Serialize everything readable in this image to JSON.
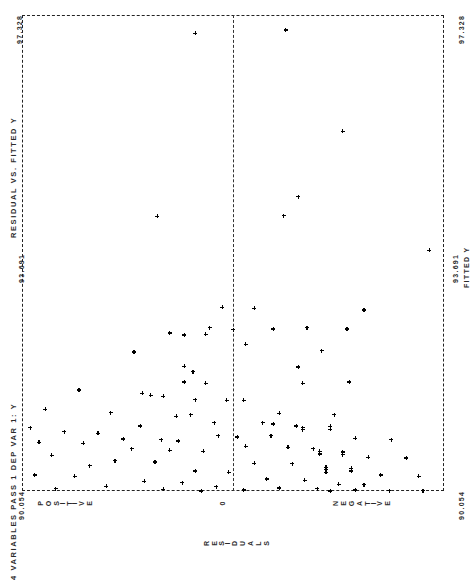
{
  "report": {
    "header_left": "4 VARIABLES  PASS 1  DEP VAR 1: Y",
    "plot_title": "RESIDUAL VS. FITTED Y"
  },
  "axis_left": {
    "tick_max": "97.328",
    "tick_mid": "93.691",
    "tick_min": "90.054"
  },
  "axis_right": {
    "tick_max": "97.328",
    "tick_mid": "93.691",
    "tick_min": "90.054",
    "label": "FITTED Y"
  },
  "axis_bottom": {
    "left_word": "POSITIVE",
    "center_word": "0",
    "right_word": "NEGATIVE",
    "caption": "RESIDUALS"
  },
  "chart_data": {
    "type": "scatter",
    "title": "RESIDUAL VS. FITTED Y",
    "subtitle": "4 VARIABLES  PASS 1  DEP VAR 1: Y",
    "orientation": "rotated-90-landscape-printout",
    "xlabel": "RESIDUALS",
    "ylabel": "FITTED Y",
    "xlim": [
      -1,
      1
    ],
    "ylim": [
      90.054,
      97.328
    ],
    "x_tick_labels": [
      "POSITIVE",
      "0",
      "NEGATIVE"
    ],
    "y_tick_labels": [
      "90.054",
      "93.691",
      "97.328"
    ],
    "grid": false,
    "legend": null,
    "marker": "plus",
    "zero_reference_line_x": 0.0,
    "n_points": 110,
    "points": [
      [
        -0.18,
        97.05
      ],
      [
        0.25,
        97.1
      ],
      [
        0.52,
        95.55
      ],
      [
        0.31,
        94.55
      ],
      [
        0.24,
        94.26
      ],
      [
        0.93,
        93.73
      ],
      [
        -0.36,
        94.25
      ],
      [
        -0.05,
        92.86
      ],
      [
        0.1,
        92.85
      ],
      [
        0.62,
        92.82
      ],
      [
        -0.11,
        92.55
      ],
      [
        0.0,
        92.52
      ],
      [
        0.19,
        92.53
      ],
      [
        0.35,
        92.55
      ],
      [
        0.54,
        92.53
      ],
      [
        -0.3,
        92.47
      ],
      [
        -0.23,
        92.44
      ],
      [
        -0.13,
        92.45
      ],
      [
        0.06,
        92.3
      ],
      [
        -0.47,
        92.18
      ],
      [
        0.42,
        92.2
      ],
      [
        -0.23,
        91.96
      ],
      [
        -0.19,
        91.88
      ],
      [
        0.31,
        91.95
      ],
      [
        -0.23,
        91.72
      ],
      [
        -0.13,
        91.7
      ],
      [
        0.33,
        91.7
      ],
      [
        0.55,
        91.72
      ],
      [
        -0.43,
        91.55
      ],
      [
        -0.39,
        91.52
      ],
      [
        -0.33,
        91.5
      ],
      [
        -0.73,
        91.6
      ],
      [
        -0.18,
        91.45
      ],
      [
        -0.03,
        91.44
      ],
      [
        0.05,
        91.44
      ],
      [
        -0.89,
        91.3
      ],
      [
        -0.2,
        91.22
      ],
      [
        0.22,
        91.24
      ],
      [
        0.48,
        91.22
      ],
      [
        -0.58,
        91.25
      ],
      [
        -0.27,
        91.2
      ],
      [
        -0.09,
        91.1
      ],
      [
        0.14,
        91.1
      ],
      [
        0.19,
        91.08
      ],
      [
        0.3,
        91.05
      ],
      [
        0.33,
        91.02
      ],
      [
        0.33,
        90.99
      ],
      [
        -0.96,
        91.02
      ],
      [
        -0.44,
        91.05
      ],
      [
        0.46,
        91.04
      ],
      [
        0.46,
        91.0
      ],
      [
        -0.8,
        90.96
      ],
      [
        -0.64,
        90.94
      ],
      [
        -0.07,
        90.9
      ],
      [
        0.02,
        90.88
      ],
      [
        0.18,
        90.9
      ],
      [
        -0.52,
        90.85
      ],
      [
        -0.34,
        90.84
      ],
      [
        -0.26,
        90.82
      ],
      [
        0.58,
        90.86
      ],
      [
        0.75,
        90.84
      ],
      [
        -0.92,
        90.8
      ],
      [
        -0.71,
        90.78
      ],
      [
        0.06,
        90.74
      ],
      [
        0.26,
        90.72
      ],
      [
        -0.48,
        90.7
      ],
      [
        -0.3,
        90.68
      ],
      [
        -0.14,
        90.66
      ],
      [
        0.38,
        90.7
      ],
      [
        0.41,
        90.66
      ],
      [
        0.41,
        90.62
      ],
      [
        0.52,
        90.65
      ],
      [
        0.52,
        90.61
      ],
      [
        -0.86,
        90.6
      ],
      [
        0.64,
        90.57
      ],
      [
        0.82,
        90.56
      ],
      [
        -0.56,
        90.52
      ],
      [
        -0.37,
        90.5
      ],
      [
        0.1,
        90.48
      ],
      [
        0.28,
        90.47
      ],
      [
        -0.68,
        90.44
      ],
      [
        0.44,
        90.42
      ],
      [
        0.44,
        90.38
      ],
      [
        0.44,
        90.34
      ],
      [
        0.56,
        90.4
      ],
      [
        0.56,
        90.36
      ],
      [
        -0.18,
        90.36
      ],
      [
        -0.02,
        90.34
      ],
      [
        0.7,
        90.3
      ],
      [
        0.88,
        90.28
      ],
      [
        -0.94,
        90.3
      ],
      [
        -0.75,
        90.28
      ],
      [
        0.16,
        90.24
      ],
      [
        0.34,
        90.22
      ],
      [
        -0.42,
        90.2
      ],
      [
        -0.24,
        90.18
      ],
      [
        0.5,
        90.16
      ],
      [
        0.62,
        90.15
      ],
      [
        -0.6,
        90.13
      ],
      [
        -0.08,
        90.12
      ],
      [
        0.22,
        90.1
      ],
      [
        0.4,
        90.09
      ],
      [
        -0.84,
        90.09
      ],
      [
        -0.33,
        90.08
      ],
      [
        0.05,
        90.07
      ],
      [
        0.58,
        90.07
      ],
      [
        0.74,
        90.06
      ],
      [
        0.9,
        90.06
      ],
      [
        -0.15,
        90.055
      ],
      [
        0.46,
        90.055
      ]
    ]
  }
}
